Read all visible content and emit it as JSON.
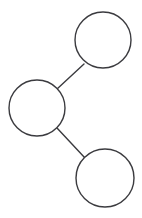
{
  "canvas": {
    "width": 142,
    "height": 218,
    "background_color": "#ffffff",
    "title": "Three-node graph"
  },
  "style": {
    "node_stroke_color": "#3b3b3f",
    "node_fill_color": "#ffffff",
    "node_stroke_width": 1.4,
    "edge_stroke_color": "#3b3b3f",
    "edge_stroke_width": 1.4
  },
  "nodes": [
    {
      "id": "node-top-right",
      "label": "",
      "cx": 103,
      "cy": 40,
      "r": 28
    },
    {
      "id": "node-middle-left",
      "label": "",
      "cx": 37,
      "cy": 108,
      "r": 28
    },
    {
      "id": "node-bottom-right",
      "label": "",
      "cx": 105,
      "cy": 178,
      "r": 29
    }
  ],
  "edges": [
    {
      "id": "edge-middle-to-top",
      "from": "node-middle-left",
      "to": "node-top-right",
      "x1": 57,
      "y1": 89,
      "x2": 84,
      "y2": 64
    },
    {
      "id": "edge-middle-to-bottom",
      "from": "node-middle-left",
      "to": "node-bottom-right",
      "x1": 57,
      "y1": 128,
      "x2": 85,
      "y2": 158
    }
  ]
}
